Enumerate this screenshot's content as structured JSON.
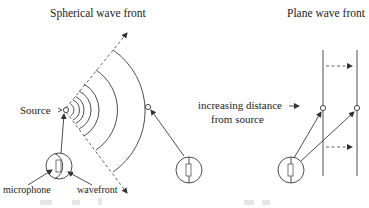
{
  "figure": {
    "left_panel": {
      "title": "Spherical wave front",
      "source_label": "Source",
      "microphone_label": "microphone",
      "wavefront_label": "wavefront"
    },
    "middle": {
      "distance_label_line1": "increasing distance",
      "distance_label_line2": "from source"
    },
    "right_panel": {
      "title": "Plane wave front"
    },
    "colors": {
      "line": "#3a3a3a",
      "dashed": "#555555",
      "text": "#222222",
      "background": "#ffffff"
    }
  }
}
